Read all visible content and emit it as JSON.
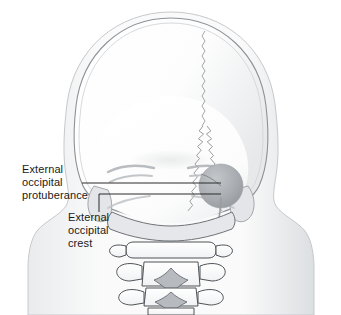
{
  "figure": {
    "view": "posterior",
    "background_color": "#ffffff",
    "line_color": "#6b6f73",
    "bone_fill": "#fbfbfb",
    "shadow_color": "#b9bdc1",
    "leader_color": "#2b2b2b",
    "protuberance_fill": "#a9adb1"
  },
  "labels": {
    "protuberance": {
      "line1": "External",
      "line2": "occipital",
      "line3": "protuberance"
    },
    "crest": {
      "line1": "External",
      "line2": "occipital",
      "line3": "crest"
    }
  },
  "structures": {
    "cranial_vault": "cranial-vault",
    "occipital_bone": "occipital-bone",
    "sagittal_suture": "sagittal-suture",
    "lambdoid_suture": "lambdoid-suture",
    "mastoid_process_left": "mastoid-process-left",
    "mastoid_process_right": "mastoid-process-right",
    "nuchal_lines": "superior-nuchal-lines",
    "external_occipital_protuberance": "external-occipital-protuberance",
    "external_occipital_crest": "external-occipital-crest",
    "vertebrae": [
      "C1-atlas",
      "C2-axis",
      "C3",
      "C4"
    ],
    "soft_tissue_outline": "head-and-neck-outline"
  }
}
